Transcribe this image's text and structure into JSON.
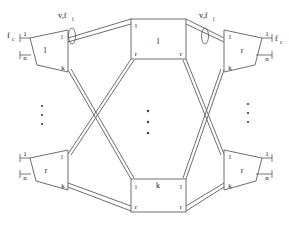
{
  "figure": {
    "colors": {
      "line": "#6e6e6e",
      "text": "#1a1a1a",
      "background": "#ffffff"
    },
    "annotations": {
      "link_top_left": "v,f",
      "link_top_left_sub": "i",
      "link_top_right": "v,f",
      "link_top_right_sub": "i",
      "left_outer_flow": "f",
      "left_outer_flow_sub": "c",
      "right_outer_flow": "f",
      "right_outer_flow_sub": "c"
    },
    "port_range": {
      "first": "1",
      "last": "n"
    },
    "nodes": [
      {
        "id": "top-left-trapezoid",
        "shape": "trapezoid",
        "center_label": "l",
        "port_top": "l",
        "port_bottom": "k",
        "outer_first": "1",
        "outer_last": "n"
      },
      {
        "id": "top-center-box",
        "shape": "box",
        "center_label": "l",
        "corner_top_left": "l",
        "corner_bottom_left": "r",
        "corner_bottom_right": "r"
      },
      {
        "id": "top-right-trapezoid",
        "shape": "trapezoid",
        "center_label": "r",
        "port_top": "l",
        "port_bottom": "k",
        "outer_first": "1",
        "outer_last": "n"
      },
      {
        "id": "bottom-left-trapezoid",
        "shape": "trapezoid",
        "center_label": "r",
        "port_top": "l",
        "port_bottom": "k",
        "outer_first": "1",
        "outer_last": "n"
      },
      {
        "id": "bottom-center-box",
        "shape": "box",
        "center_label": "k",
        "corner_top_left": "l",
        "corner_top_right": "l",
        "corner_bottom_left": "r",
        "corner_bottom_right": "r"
      },
      {
        "id": "bottom-right-trapezoid",
        "shape": "trapezoid",
        "center_label": "r",
        "port_top": "l",
        "port_bottom": "k",
        "outer_first": "1",
        "outer_last": "n"
      }
    ],
    "ellipses": [
      {
        "id": "vertical-dots-left",
        "glyph": "vertical-ellipsis",
        "count": 3
      },
      {
        "id": "vertical-dots-center",
        "glyph": "vertical-ellipsis",
        "count": 3
      },
      {
        "id": "vertical-dots-right",
        "glyph": "vertical-ellipsis",
        "count": 3
      }
    ]
  }
}
